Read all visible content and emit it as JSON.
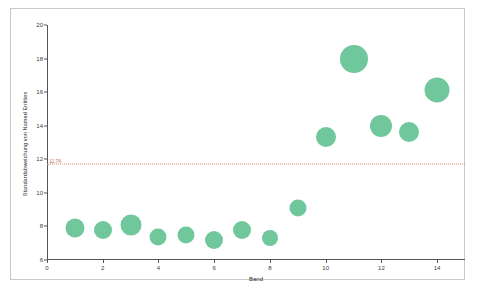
{
  "chart_data": {
    "type": "scatter",
    "title": "",
    "xlabel": "Band",
    "ylabel": "Standardabweichung von Named Entities",
    "xlim": [
      0,
      15
    ],
    "ylim": [
      6,
      20
    ],
    "xticks": [
      0,
      2,
      4,
      6,
      8,
      10,
      12,
      14
    ],
    "yticks": [
      6,
      8,
      10,
      12,
      14,
      16,
      18,
      20
    ],
    "grid": false,
    "legend": null,
    "marker_color": "#70c79c",
    "reference_line": {
      "value": 11.74,
      "label": "11.74",
      "color": "#d98a78",
      "style": "dotted",
      "orientation": "horizontal"
    },
    "x": [
      1,
      2,
      3,
      4,
      5,
      6,
      7,
      8,
      9,
      10,
      11,
      12,
      13,
      14
    ],
    "y": [
      7.9,
      7.8,
      8.1,
      7.4,
      7.5,
      7.2,
      7.8,
      7.3,
      9.1,
      13.3,
      18.0,
      14.0,
      13.6,
      16.1
    ],
    "sizes": [
      19,
      18,
      21,
      17,
      17,
      18,
      18,
      16,
      17,
      20,
      28,
      22,
      20,
      25
    ],
    "series": [
      {
        "name": "Bands",
        "points": [
          {
            "band": 1,
            "value": 7.9,
            "size": 19
          },
          {
            "band": 2,
            "value": 7.8,
            "size": 18
          },
          {
            "band": 3,
            "value": 8.1,
            "size": 21
          },
          {
            "band": 4,
            "value": 7.4,
            "size": 17
          },
          {
            "band": 5,
            "value": 7.5,
            "size": 17
          },
          {
            "band": 6,
            "value": 7.2,
            "size": 18
          },
          {
            "band": 7,
            "value": 7.8,
            "size": 18
          },
          {
            "band": 8,
            "value": 7.3,
            "size": 16
          },
          {
            "band": 9,
            "value": 9.1,
            "size": 17
          },
          {
            "band": 10,
            "value": 13.3,
            "size": 20
          },
          {
            "band": 11,
            "value": 18.0,
            "size": 28
          },
          {
            "band": 12,
            "value": 14.0,
            "size": 22
          },
          {
            "band": 13,
            "value": 13.6,
            "size": 20
          },
          {
            "band": 14,
            "value": 16.1,
            "size": 25
          }
        ]
      }
    ]
  }
}
